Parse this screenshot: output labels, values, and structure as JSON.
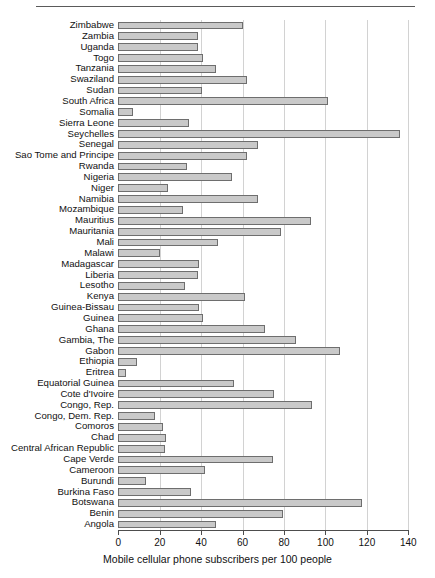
{
  "chart_data": {
    "type": "bar",
    "orientation": "horizontal",
    "title": "",
    "xlabel": "Mobile cellular phone subscribers per 100 people",
    "ylabel": "",
    "xlim": [
      0,
      140
    ],
    "xticks": [
      0,
      20,
      40,
      60,
      80,
      100,
      120,
      140
    ],
    "grid": "vertical",
    "legend": "none",
    "bar_color": "#c9c9c9",
    "bar_edge_color": "#6e6e6e",
    "categories": [
      "Zimbabwe",
      "Zambia",
      "Uganda",
      "Togo",
      "Tanzania",
      "Swaziland",
      "Sudan",
      "South Africa",
      "Somalia",
      "Sierra Leone",
      "Seychelles",
      "Senegal",
      "Sao Tome and Principe",
      "Rwanda",
      "Nigeria",
      "Niger",
      "Namibia",
      "Mozambique",
      "Mauritius",
      "Mauritania",
      "Mali",
      "Malawi",
      "Madagascar",
      "Liberia",
      "Lesotho",
      "Kenya",
      "Guinea-Bissau",
      "Guinea",
      "Ghana",
      "Gambia, The",
      "Gabon",
      "Ethiopia",
      "Eritrea",
      "Equatorial Guinea",
      "Cote d'Ivoire",
      "Congo, Rep.",
      "Congo, Dem. Rep.",
      "Comoros",
      "Chad",
      "Central African Republic",
      "Cape Verde",
      "Cameroon",
      "Burundi",
      "Burkina Faso",
      "Botswana",
      "Benin",
      "Angola"
    ],
    "values": [
      60,
      38.5,
      38.5,
      41,
      47,
      62,
      40.5,
      101,
      7,
      34,
      136,
      67.5,
      62,
      33,
      55,
      24,
      67.5,
      31,
      93,
      78.5,
      48,
      20,
      39,
      38.5,
      32,
      61,
      39,
      41,
      71,
      86,
      107,
      9,
      3.5,
      56,
      75,
      93.5,
      17.5,
      21.5,
      23,
      22.5,
      74.5,
      42,
      13.5,
      35,
      117.5,
      79.5,
      47
    ]
  }
}
